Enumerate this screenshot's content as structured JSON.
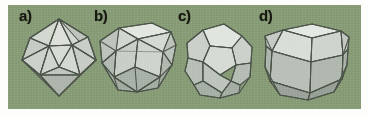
{
  "figure": {
    "background_color": "#fdfdfc",
    "panel_color": "#879c77",
    "face_color": "#c9cec7",
    "edge_color": "#4c544a",
    "label_color": "#16170f",
    "panel": {
      "x": 8,
      "y": 5,
      "width": 353,
      "height": 104
    },
    "items": [
      {
        "label": "a)",
        "name": "icosahedron",
        "faces": 20,
        "face_shape": "triangle",
        "label_position": {
          "x": 11,
          "y": 3
        },
        "cell": {
          "x": 8,
          "y": 0,
          "width": 86,
          "height": 104
        }
      },
      {
        "label": "b)",
        "name": "cuboctahedron",
        "faces": 14,
        "face_shape": "square-and-triangle",
        "label_position": {
          "x": 86,
          "y": 3
        },
        "cell": {
          "x": 84,
          "y": 0,
          "width": 88,
          "height": 104
        }
      },
      {
        "label": "c)",
        "name": "dodecahedron",
        "faces": 12,
        "face_shape": "pentagon",
        "label_position": {
          "x": 170,
          "y": 3
        },
        "cell": {
          "x": 166,
          "y": 0,
          "width": 88,
          "height": 104
        }
      },
      {
        "label": "d)",
        "name": "rhombic-dodecahedron",
        "faces": 12,
        "face_shape": "rhombus",
        "label_position": {
          "x": 251,
          "y": 3
        },
        "cell": {
          "x": 248,
          "y": 0,
          "width": 98,
          "height": 104
        }
      }
    ]
  }
}
